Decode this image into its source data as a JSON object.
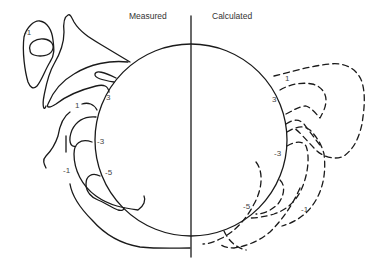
{
  "diagram": {
    "type": "contour-comparison",
    "panels": {
      "left": {
        "title": "Measured",
        "line_style": "solid"
      },
      "right": {
        "title": "Calculated",
        "line_style": "dashed"
      }
    },
    "measured_labels": [
      {
        "id": "m-neg1-top",
        "text": "-1"
      },
      {
        "id": "m-3",
        "text": "3"
      },
      {
        "id": "m-1",
        "text": "1"
      },
      {
        "id": "m-neg3",
        "text": "-3"
      },
      {
        "id": "m-neg5",
        "text": "-5"
      },
      {
        "id": "m-neg1-bottom",
        "text": "-1"
      }
    ],
    "calculated_labels": [
      {
        "id": "c-1",
        "text": "1"
      },
      {
        "id": "c-3",
        "text": "3"
      },
      {
        "id": "c-neg3",
        "text": "-3"
      },
      {
        "id": "c-neg5",
        "text": "-5"
      },
      {
        "id": "c-neg1",
        "text": "-1"
      }
    ],
    "colors": {
      "line": "#1a1a1a",
      "label": "#444444",
      "background": "#ffffff"
    }
  }
}
